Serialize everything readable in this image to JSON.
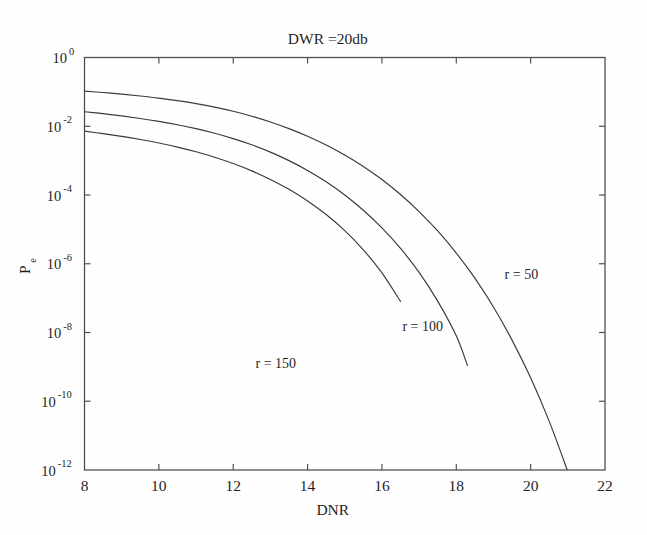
{
  "chart_data": {
    "type": "line",
    "title": "DWR =20db",
    "subtitle": "",
    "xlabel": "DNR",
    "ylabel": "P",
    "ylabel_subscript": "e",
    "yscale": "log",
    "xscale": "linear",
    "xlim": [
      8,
      22
    ],
    "ylim": [
      1e-12,
      1
    ],
    "xticks": [
      8,
      10,
      12,
      14,
      16,
      18,
      20,
      22
    ],
    "xtick_labels": [
      "8",
      "10",
      "12",
      "14",
      "16",
      "18",
      "20",
      "22"
    ],
    "yticks": [
      1,
      0.01,
      0.0001,
      1e-06,
      1e-08,
      1e-10,
      1e-12
    ],
    "ytick_labels": [
      "10^0",
      "10^-2",
      "10^-4",
      "10^-6",
      "10^-8",
      "10^-10",
      "10^-12"
    ],
    "ytick_mantissa": [
      "10",
      "10",
      "10",
      "10",
      "10",
      "10",
      "10"
    ],
    "ytick_exponents": [
      "0",
      "-2",
      "-4",
      "-6",
      "-8",
      "-10",
      "-12"
    ],
    "grid": false,
    "legend": "inline-annotations",
    "legend_position": "inside-plot",
    "line_color": "#3a3a3a",
    "axis_color": "#4a4a4a",
    "background_color": "#ffffff",
    "series": [
      {
        "name": "r = 50",
        "label": "r = 50",
        "label_x": 19.3,
        "label_y": 3.5e-07,
        "x": [
          8,
          8.5,
          9,
          9.5,
          10,
          10.5,
          11,
          11.5,
          12,
          12.5,
          13,
          13.5,
          14,
          14.5,
          15,
          15.5,
          16,
          16.5,
          17,
          17.5,
          18,
          18.5,
          19,
          19.5,
          20,
          20.5,
          21,
          21.4
        ],
        "y": [
          0.105,
          0.096,
          0.086,
          0.076,
          0.066,
          0.0555,
          0.0455,
          0.036,
          0.0272,
          0.0196,
          0.01335,
          0.00855,
          0.00512,
          0.00285,
          0.001455,
          0.000675,
          0.000281,
          0.0001035,
          3.3e-05,
          9e-06,
          2.05e-06,
          3.8e-07,
          5.5e-08,
          6e-09,
          4.8e-10,
          2.6e-11,
          9e-13,
          9e-14
        ]
      },
      {
        "name": "r = 100",
        "label": "r = 100",
        "label_x": 16.55,
        "label_y": 1.1e-08,
        "x": [
          8,
          8.5,
          9,
          9.5,
          10,
          10.5,
          11,
          11.5,
          12,
          12.5,
          13,
          13.5,
          14,
          14.5,
          15,
          15.5,
          16,
          16.5,
          17,
          17.5,
          18,
          18.3
        ],
        "y": [
          0.0265,
          0.0232,
          0.02,
          0.01685,
          0.01385,
          0.01105,
          0.0085,
          0.00625,
          0.00437,
          0.00288,
          0.00177,
          0.001,
          0.000518,
          0.000242,
          0.0001,
          3.6e-05,
          1.1e-05,
          2.8e-06,
          5.6e-07,
          8.2e-08,
          8e-09,
          1.1e-09
        ]
      },
      {
        "name": "r = 150",
        "label": "r = 150",
        "label_x": 12.6,
        "label_y": 9e-10,
        "x": [
          8,
          8.5,
          9,
          9.5,
          10,
          10.5,
          11,
          11.5,
          12,
          12.5,
          13,
          13.5,
          14,
          14.5,
          15,
          15.5,
          16,
          16.5
        ],
        "y": [
          0.0072,
          0.0061,
          0.00508,
          0.00413,
          0.00326,
          0.00248,
          0.00181,
          0.001255,
          0.000822,
          0.000503,
          0.000284,
          0.000146,
          6.7e-05,
          2.7e-05,
          9.2e-06,
          2.55e-06,
          5.4e-07,
          8e-08
        ]
      }
    ]
  }
}
